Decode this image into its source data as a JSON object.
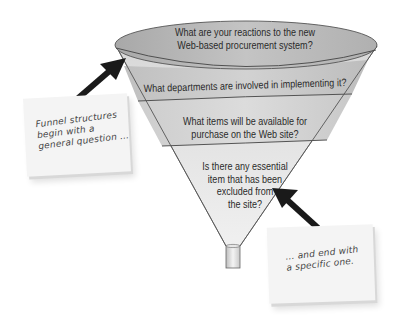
{
  "diagram": {
    "type": "funnel",
    "colors": {
      "band_top": "#b9b9b9",
      "band_mid": "#cdcdcd",
      "band_light": "#dedede",
      "outline": "#555555",
      "arrow": "#1a1a1a",
      "note_bg": "#f4f4f4"
    },
    "levels": [
      {
        "order": 1,
        "text_lines": [
          "What are your reactions to the new",
          "Web-based procurement system?"
        ]
      },
      {
        "order": 2,
        "text_lines": [
          "What departments are involved in implementing it?"
        ]
      },
      {
        "order": 3,
        "text_lines": [
          "What items will be available for",
          "purchase on the Web site?"
        ]
      },
      {
        "order": 4,
        "text_lines": [
          "Is there any essential",
          "item that has been",
          "excluded from",
          "the site?"
        ]
      }
    ],
    "annotations": [
      {
        "position": "left",
        "text_lines": [
          "Funnel structures",
          "begin with a",
          "general question …"
        ],
        "points_to": "level-1"
      },
      {
        "position": "bottom-right",
        "text_lines": [
          "… and end with",
          "a specific one."
        ],
        "points_to": "level-4"
      }
    ]
  }
}
